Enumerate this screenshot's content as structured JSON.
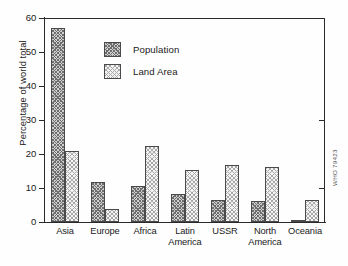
{
  "chart_data": {
    "type": "bar",
    "title": "",
    "xlabel": "",
    "ylabel": "Percentage of world total",
    "ylim": [
      0,
      60
    ],
    "yticks": [
      0,
      10,
      20,
      30,
      40,
      50,
      60
    ],
    "grid": false,
    "legend_position": "upper-center",
    "categories": [
      "Asia",
      "Europe",
      "Africa",
      "Latin America",
      "USSR",
      "North America",
      "Oceania"
    ],
    "category_lines": [
      [
        "Asia"
      ],
      [
        "Europe"
      ],
      [
        "Africa"
      ],
      [
        "Latin",
        "America"
      ],
      [
        "USSR"
      ],
      [
        "North",
        "America"
      ],
      [
        "Oceania"
      ]
    ],
    "series": [
      {
        "name": "Population",
        "pattern": "diagonal-hatch",
        "values": [
          57.0,
          11.8,
          10.7,
          8.3,
          6.4,
          6.1,
          0.6
        ]
      },
      {
        "name": "Land Area",
        "pattern": "light-stipple",
        "values": [
          20.8,
          3.7,
          22.4,
          15.2,
          16.8,
          16.2,
          6.5
        ]
      }
    ],
    "annotations": [
      "WHO 79423"
    ]
  },
  "axis": {
    "y_title": "Percentage of world total",
    "tick_labels": [
      "60",
      "50",
      "40",
      "30",
      "20",
      "10",
      "0"
    ]
  },
  "legend": {
    "items": [
      {
        "label": "Population"
      },
      {
        "label": "Land Area"
      }
    ]
  },
  "source": {
    "code": "WHO 79423"
  },
  "colors": {
    "axis": "#2a2a2a",
    "bar_outline": "#4a4a4a",
    "population_fill": "#cfcfcf",
    "landarea_fill": "#f3f3f3",
    "background": "#ffffff"
  }
}
